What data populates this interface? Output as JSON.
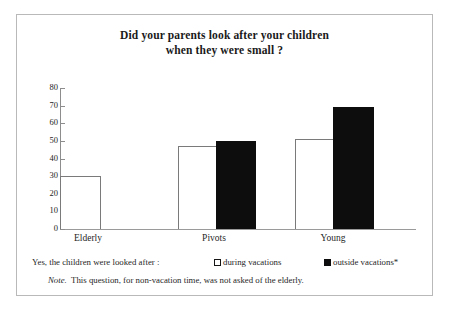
{
  "chart_data": {
    "type": "bar",
    "title": "Did your parents look after your children when they were small ?",
    "title_line1": "Did your parents look after your children",
    "title_line2": "when they were small ?",
    "xlabel": "",
    "ylabel": "",
    "ylim": [
      0,
      80
    ],
    "yticks": [
      0,
      10,
      20,
      30,
      40,
      50,
      60,
      70,
      80
    ],
    "ytick_labels": [
      "0",
      "10",
      "20",
      "30",
      "40",
      "50",
      "60",
      "70",
      "80"
    ],
    "grid": false,
    "legend_position": "below-plot",
    "categories": [
      "Elderly",
      "Pivots",
      "Young"
    ],
    "series": [
      {
        "name": "during vacations",
        "values": [
          30,
          47,
          51
        ],
        "color": "#ffffff",
        "edge": "#7a7a7a"
      },
      {
        "name": "outside vacations*",
        "values": [
          null,
          50,
          69
        ],
        "color": "#0d0d0d",
        "edge": "#0d0d0d"
      }
    ],
    "legend_lead_text": "Yes, the children were looked after :",
    "note_prefix": "Note.",
    "note_text": "This question, for non-vacation time, was not asked of the elderly."
  },
  "figure": {
    "border_color": "#b9b9b9",
    "background": "#ffffff",
    "axis_color": "#8d8d8d"
  }
}
